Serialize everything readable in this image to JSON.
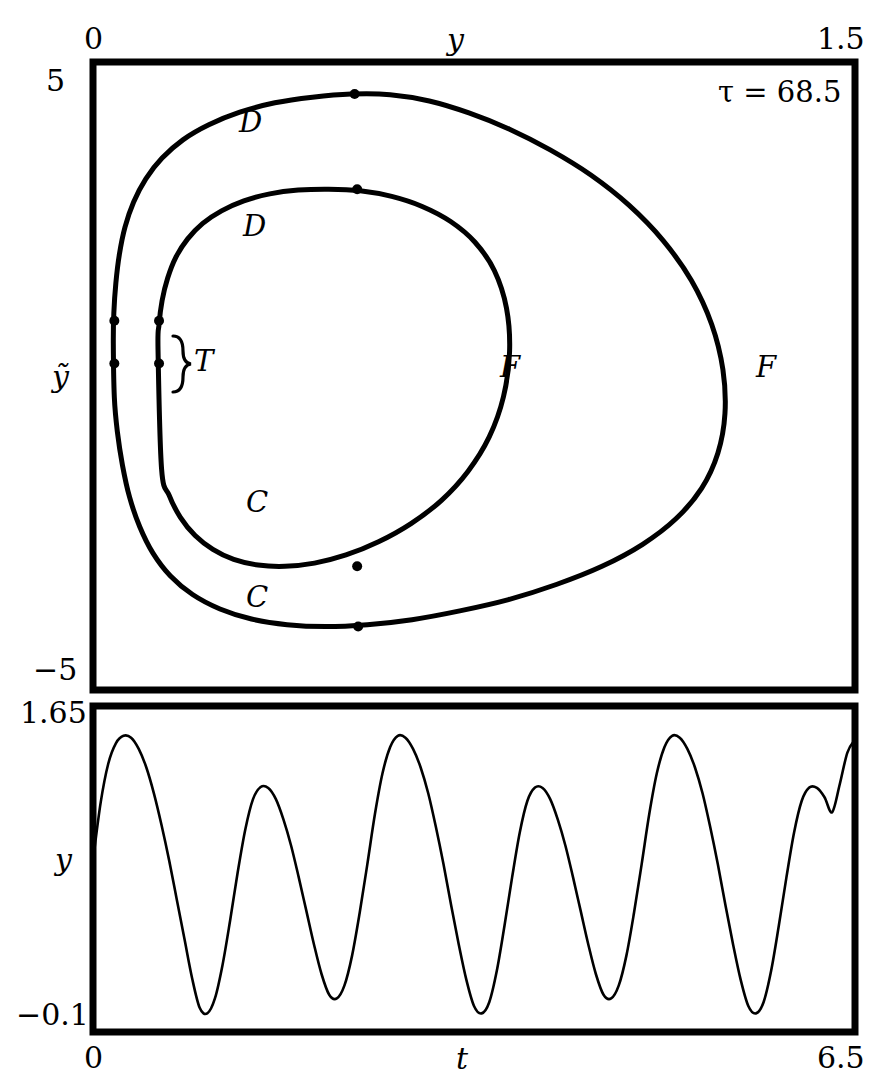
{
  "figure": {
    "type": "two-panel-dynamical-systems-figure",
    "width": 894,
    "height": 1091,
    "ink_color": "#000000",
    "background_color": "#ffffff"
  },
  "phase_panel": {
    "name": "phase-portrait",
    "annotation": "τ = 68.5",
    "x_axis": {
      "label": "y",
      "min_label": "0",
      "max_label": "1.5",
      "min": 0,
      "max": 1.5,
      "position": "top"
    },
    "y_axis": {
      "label": "ỹ",
      "min_label": "−5",
      "max_label": "5",
      "min": -5,
      "max": 5,
      "position": "left"
    },
    "curve_labels": [
      {
        "text": "D",
        "role": "upper-branch-outer-loop"
      },
      {
        "text": "D",
        "role": "upper-branch-inner-loop"
      },
      {
        "text": "F",
        "role": "right-turn-inner-loop"
      },
      {
        "text": "F",
        "role": "right-turn-outer-loop"
      },
      {
        "text": "C",
        "role": "lower-branch-inner-loop"
      },
      {
        "text": "C",
        "role": "lower-branch-outer-loop"
      }
    ],
    "brace_label": "T",
    "marker_count": 8
  },
  "time_panel": {
    "name": "time-series",
    "x_axis": {
      "label": "t",
      "min_label": "0",
      "max_label": "6.5",
      "min": 0,
      "max": 6.5,
      "position": "bottom"
    },
    "y_axis": {
      "label": "y",
      "min_label": "−0.1",
      "max_label": "1.65",
      "min": -0.1,
      "max": 1.65,
      "position": "left"
    }
  },
  "chart_data": [
    {
      "type": "line",
      "name": "phase-portrait",
      "title": "",
      "subtitle": "τ = 68.5",
      "xlabel": "y",
      "ylabel": "ỹ",
      "xlim": [
        0,
        1.5
      ],
      "ylim": [
        -5,
        5
      ],
      "grid": false,
      "legend": "none",
      "annotations": [
        {
          "text": "τ = 68.5",
          "x": 1.33,
          "y": 4.55
        },
        {
          "text": "D",
          "x": 0.285,
          "y": 4.2
        },
        {
          "text": "D",
          "x": 0.29,
          "y": 2.75
        },
        {
          "text": "F",
          "x": 0.79,
          "y": 0.1
        },
        {
          "text": "F",
          "x": 1.25,
          "y": 0.1
        },
        {
          "text": "C",
          "x": 0.3,
          "y": -1.4
        },
        {
          "text": "C",
          "x": 0.3,
          "y": -2.75
        },
        {
          "text": "T",
          "x": 0.23,
          "y": 0.3
        }
      ],
      "series": [
        {
          "name": "outer-loop",
          "closed": true,
          "x": [
            0.04,
            0.041,
            0.045,
            0.052,
            0.063,
            0.08,
            0.104,
            0.136,
            0.177,
            0.228,
            0.289,
            0.358,
            0.432,
            0.508,
            0.585,
            0.662,
            0.74,
            0.82,
            0.9,
            0.98,
            1.055,
            1.122,
            1.178,
            1.218,
            1.24,
            1.244,
            1.23,
            1.198,
            1.148,
            1.082,
            1.002,
            0.912,
            0.818,
            0.722,
            0.628,
            0.54,
            0.458,
            0.382,
            0.312,
            0.25,
            0.196,
            0.152,
            0.118,
            0.092,
            0.072,
            0.058,
            0.048,
            0.042,
            0.04
          ],
          "y": [
            0.52,
            1.0,
            1.48,
            1.94,
            2.37,
            2.77,
            3.14,
            3.47,
            3.76,
            4.0,
            4.2,
            4.35,
            4.44,
            4.49,
            4.48,
            4.38,
            4.19,
            3.93,
            3.6,
            3.2,
            2.72,
            2.16,
            1.52,
            0.82,
            0.1,
            -0.6,
            -1.23,
            -1.79,
            -2.27,
            -2.68,
            -3.03,
            -3.32,
            -3.56,
            -3.74,
            -3.88,
            -3.96,
            -3.99,
            -3.96,
            -3.87,
            -3.71,
            -3.48,
            -3.18,
            -2.82,
            -2.4,
            -1.93,
            -1.42,
            -0.89,
            -0.34,
            0.52
          ]
        },
        {
          "name": "inner-loop",
          "closed": true,
          "x": [
            0.128,
            0.13,
            0.136,
            0.147,
            0.163,
            0.186,
            0.216,
            0.253,
            0.297,
            0.348,
            0.404,
            0.464,
            0.526,
            0.588,
            0.648,
            0.704,
            0.752,
            0.79,
            0.814,
            0.82,
            0.808,
            0.78,
            0.738,
            0.686,
            0.626,
            0.562,
            0.498,
            0.436,
            0.378,
            0.325,
            0.277,
            0.236,
            0.201,
            0.172,
            0.15,
            0.135,
            0.128
          ],
          "y": [
            0.42,
            0.82,
            1.2,
            1.56,
            1.89,
            2.18,
            2.43,
            2.63,
            2.79,
            2.9,
            2.96,
            2.975,
            2.95,
            2.86,
            2.7,
            2.46,
            2.13,
            1.68,
            1.08,
            0.38,
            -0.33,
            -0.97,
            -1.52,
            -1.98,
            -2.35,
            -2.64,
            -2.85,
            -2.98,
            -3.03,
            -3.01,
            -2.92,
            -2.76,
            -2.54,
            -2.25,
            -1.9,
            -1.48,
            0.42
          ]
        }
      ],
      "markers": [
        {
          "x": 0.515,
          "y": 4.49,
          "on": "outer-loop",
          "role": "D-apex"
        },
        {
          "x": 0.52,
          "y": 2.975,
          "on": "inner-loop",
          "role": "D-apex"
        },
        {
          "x": 0.52,
          "y": -3.03,
          "on": "inner-loop",
          "role": "C-bottom"
        },
        {
          "x": 0.522,
          "y": -3.99,
          "on": "outer-loop",
          "role": "C-bottom"
        },
        {
          "x": 0.042,
          "y": 0.88,
          "on": "outer-loop",
          "role": "T-upper"
        },
        {
          "x": 0.042,
          "y": 0.2,
          "on": "outer-loop",
          "role": "T-lower"
        },
        {
          "x": 0.13,
          "y": 0.88,
          "on": "inner-loop",
          "role": "T-upper"
        },
        {
          "x": 0.13,
          "y": 0.2,
          "on": "inner-loop",
          "role": "T-lower"
        }
      ]
    },
    {
      "type": "line",
      "name": "time-series",
      "title": "",
      "xlabel": "t",
      "ylabel": "y",
      "xlim": [
        0,
        6.5
      ],
      "ylim": [
        -0.1,
        1.65
      ],
      "grid": false,
      "legend": "none",
      "description": "Period-2 oscillation of y(t): alternating tall peaks (~1.49) and smaller peaks (~1.22), separated by deep minima near 0.0 and 0.05.",
      "peaks": [
        {
          "t": 0.33,
          "y": 1.49
        },
        {
          "t": 1.3,
          "y": 1.22
        },
        {
          "t": 2.32,
          "y": 1.49
        },
        {
          "t": 3.28,
          "y": 1.22
        },
        {
          "t": 4.3,
          "y": 1.49
        },
        {
          "t": 5.27,
          "y": 1.22
        },
        {
          "t": 6.38,
          "y": 1.47
        }
      ],
      "troughs": [
        {
          "t": 0.84,
          "y": 0.0
        },
        {
          "t": 1.8,
          "y": 0.08
        },
        {
          "t": 2.83,
          "y": 0.0
        },
        {
          "t": 3.79,
          "y": 0.08
        },
        {
          "t": 4.82,
          "y": 0.0
        },
        {
          "t": 5.79,
          "y": 0.08
        }
      ],
      "x": [
        0.0,
        0.065,
        0.13,
        0.195,
        0.26,
        0.325,
        0.39,
        0.455,
        0.52,
        0.585,
        0.65,
        0.715,
        0.78,
        0.845,
        0.91,
        0.975,
        1.04,
        1.105,
        1.17,
        1.235,
        1.3,
        1.365,
        1.43,
        1.495,
        1.56,
        1.625,
        1.69,
        1.755,
        1.82,
        1.885,
        1.95,
        2.015,
        2.08,
        2.145,
        2.21,
        2.275,
        2.34,
        2.405,
        2.47,
        2.535,
        2.6,
        2.665,
        2.73,
        2.795,
        2.86,
        2.925,
        2.99,
        3.055,
        3.12,
        3.185,
        3.25,
        3.315,
        3.38,
        3.445,
        3.51,
        3.575,
        3.64,
        3.705,
        3.77,
        3.835,
        3.9,
        3.965,
        4.03,
        4.095,
        4.16,
        4.225,
        4.29,
        4.355,
        4.42,
        4.485,
        4.55,
        4.615,
        4.68,
        4.745,
        4.81,
        4.875,
        4.94,
        5.005,
        5.07,
        5.135,
        5.2,
        5.265,
        5.33,
        5.395,
        5.46,
        5.525,
        5.59,
        5.655,
        5.72,
        5.785,
        5.85,
        5.915,
        5.98,
        6.045,
        6.11,
        6.175,
        6.24,
        6.305,
        6.37,
        6.435,
        6.5
      ],
      "y": [
        0.82,
        1.13,
        1.34,
        1.45,
        1.49,
        1.48,
        1.42,
        1.32,
        1.18,
        1.01,
        0.82,
        0.61,
        0.4,
        0.19,
        0.03,
        0.0,
        0.08,
        0.26,
        0.5,
        0.76,
        0.99,
        1.15,
        1.215,
        1.21,
        1.15,
        1.04,
        0.9,
        0.73,
        0.55,
        0.37,
        0.21,
        0.1,
        0.08,
        0.15,
        0.31,
        0.54,
        0.8,
        1.07,
        1.29,
        1.43,
        1.49,
        1.48,
        1.42,
        1.32,
        1.18,
        1.0,
        0.8,
        0.58,
        0.37,
        0.18,
        0.04,
        0.0,
        0.06,
        0.23,
        0.47,
        0.73,
        0.97,
        1.14,
        1.212,
        1.21,
        1.15,
        1.04,
        0.9,
        0.73,
        0.55,
        0.37,
        0.21,
        0.1,
        0.08,
        0.15,
        0.31,
        0.54,
        0.8,
        1.07,
        1.29,
        1.43,
        1.49,
        1.48,
        1.42,
        1.32,
        1.18,
        1.0,
        0.8,
        0.58,
        0.37,
        0.18,
        0.04,
        0.0,
        0.06,
        0.23,
        0.47,
        0.73,
        0.97,
        1.14,
        1.212,
        1.21,
        1.16,
        1.08,
        1.23,
        1.4,
        1.47
      ]
    }
  ]
}
